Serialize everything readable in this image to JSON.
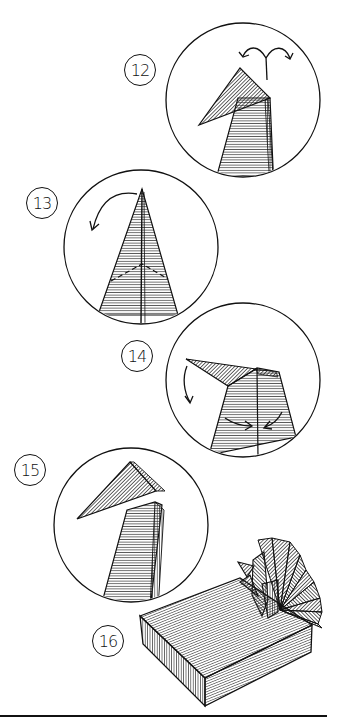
{
  "diagram": {
    "type": "origami folding instructions",
    "steps": [
      {
        "number": "12",
        "label_pos": [
          140,
          70
        ],
        "circle": {
          "cx": 243,
          "cy": 100,
          "r": 77
        },
        "description": "head triangle with two-way reverse fold arrows above"
      },
      {
        "number": "13",
        "label_pos": [
          42,
          203
        ],
        "circle": {
          "cx": 141,
          "cy": 247,
          "r": 77
        },
        "description": "tall narrow kite with dashed valley lines, curved arrow at upper left"
      },
      {
        "number": "14",
        "label_pos": [
          137,
          356
        ],
        "circle": {
          "cx": 243,
          "cy": 380,
          "r": 77
        },
        "description": "neck with head bent left, downward arrow at left, two inward arrows at base"
      },
      {
        "number": "15",
        "label_pos": [
          30,
          470
        ],
        "circle": {
          "cx": 131,
          "cy": 525,
          "r": 77
        },
        "description": "finished head and neck, beak pointing left"
      },
      {
        "number": "16",
        "label_pos": [
          108,
          641
        ],
        "description": "completed peacock with fanned tail perched on a rectangular box"
      }
    ],
    "colors": {
      "ink": "#111111",
      "paper": "#ffffff"
    }
  }
}
